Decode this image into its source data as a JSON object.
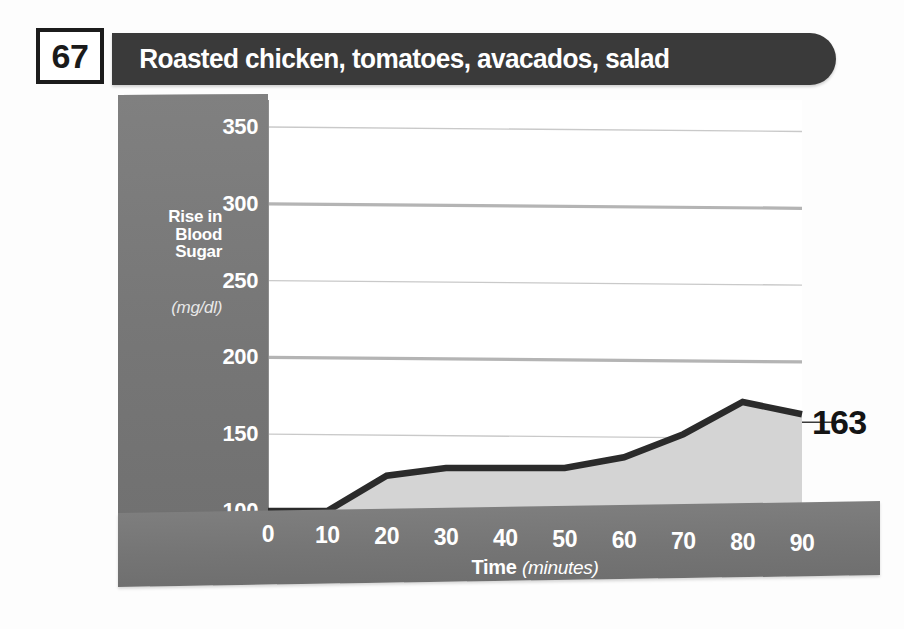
{
  "header": {
    "number": "67",
    "title": "Roasted chicken, tomatoes, avacados, salad"
  },
  "axis": {
    "y_title_line1": "Rise in",
    "y_title_line2": "Blood",
    "y_title_line3": "Sugar",
    "y_units": "(mg/dl)",
    "x_title": "Time",
    "x_units": "(minutes)"
  },
  "end_value_label": "163",
  "colors": {
    "title_bar": "#3a3a3a",
    "panel_gray": "#7b7b7b",
    "area_fill": "#d4d4d4",
    "line": "#2b2b2b",
    "gridline_light": "#c9c9c9",
    "gridline_heavy": "#b4b4b4",
    "text_light": "#ffffff",
    "text_dark": "#141414"
  },
  "chart_data": {
    "type": "line",
    "title": "Roasted chicken, tomatoes, avacados, salad",
    "xlabel": "Time (minutes)",
    "ylabel": "Rise in Blood Sugar (mg/dl)",
    "x": [
      0,
      10,
      20,
      30,
      40,
      50,
      60,
      70,
      80,
      90
    ],
    "values": [
      100,
      100,
      123,
      128,
      128,
      128,
      135,
      150,
      171,
      163
    ],
    "xlim": [
      0,
      90
    ],
    "ylim": [
      100,
      350
    ],
    "xticks": [
      "0",
      "10",
      "20",
      "30",
      "40",
      "50",
      "60",
      "70",
      "80",
      "90"
    ],
    "yticks": [
      "100",
      "150",
      "200",
      "250",
      "300",
      "350"
    ],
    "ytick_values": [
      100,
      150,
      200,
      250,
      300,
      350
    ],
    "gridlines": [
      {
        "value": 350,
        "weight": "light"
      },
      {
        "value": 300,
        "weight": "heavy"
      },
      {
        "value": 250,
        "weight": "light"
      },
      {
        "value": 200,
        "weight": "heavy"
      },
      {
        "value": 150,
        "weight": "light"
      }
    ],
    "grid": true,
    "legend": false,
    "fill": true,
    "annotations": [
      {
        "text": "163",
        "x": 90,
        "y": 163
      }
    ]
  }
}
